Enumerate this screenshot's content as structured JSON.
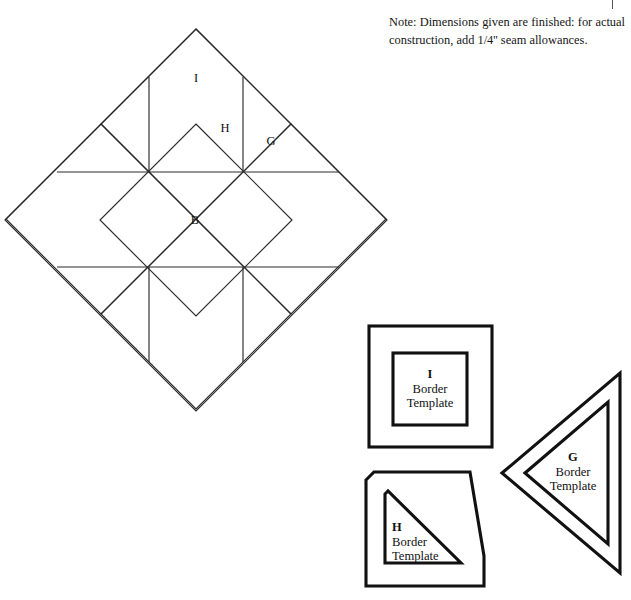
{
  "page": {
    "width": 631,
    "height": 600,
    "background": "#ffffff",
    "ink": "#1a1a1a"
  },
  "note": {
    "name": "construction-note",
    "text": "Note: Dimensions given are finished: for actual construction, add 1/4'' seam allowances."
  },
  "block_diagram": {
    "name": "quilt-block-diagram",
    "center_x": 196,
    "center_y": 220,
    "half_diagonal": 192,
    "piece_labels": [
      {
        "key": "I",
        "x": 196,
        "y": 78
      },
      {
        "key": "H",
        "x": 225,
        "y": 128
      },
      {
        "key": "G",
        "x": 271,
        "y": 141
      },
      {
        "key": "B",
        "x": 195,
        "y": 220
      }
    ]
  },
  "templates": [
    {
      "name": "template-i",
      "key": "I",
      "line1": "Border",
      "line2": "Template",
      "shape": "square-in-square",
      "label_x": 430,
      "label_y": 389
    },
    {
      "name": "template-g",
      "key": "G",
      "line1": "Border",
      "line2": "Template",
      "shape": "left-pointing-triangle",
      "label_x": 573,
      "label_y": 472
    },
    {
      "name": "template-h",
      "key": "H",
      "line1": "Border",
      "line2": "Template",
      "shape": "right-triangle-clipped",
      "label_x": 393,
      "label_y": 542
    }
  ],
  "colors": {
    "line": "#2a2a2a",
    "template_line": "#111111",
    "paper": "#ffffff"
  }
}
